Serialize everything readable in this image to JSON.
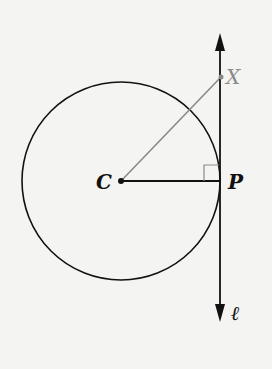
{
  "diagram": {
    "type": "geometry-tangent-line",
    "points": {
      "C": {
        "label": "C",
        "x": 121,
        "y": 181
      },
      "P": {
        "label": "P",
        "x": 220,
        "y": 181
      },
      "X": {
        "label": "X",
        "x": 221,
        "y": 77
      }
    },
    "circle": {
      "center": "C",
      "radius": 99
    },
    "line": {
      "label": "ℓ",
      "x": 220,
      "y_top": 33,
      "y_bottom": 322
    },
    "segments": [
      {
        "from": "C",
        "to": "P",
        "color": "#111111"
      },
      {
        "from": "C",
        "to": "X",
        "color": "#8a8a8a"
      }
    ],
    "right_angle_at": "P",
    "colors": {
      "ink": "#111111",
      "gray": "#8a8a8a",
      "background": "#f4f4f2"
    }
  }
}
